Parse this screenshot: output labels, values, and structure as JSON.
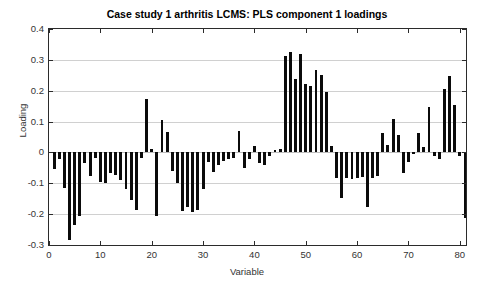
{
  "chart_data": {
    "type": "bar",
    "title": "Case study 1 arthritis LCMS: PLS component 1 loadings",
    "xlabel": "Variable",
    "ylabel": "Loading",
    "xlim": [
      0,
      81.2
    ],
    "ylim": [
      -0.3,
      0.4
    ],
    "grid": true,
    "legend": null,
    "xticks": [
      0,
      10,
      20,
      30,
      40,
      50,
      60,
      70,
      80
    ],
    "yticks": [
      -0.3,
      -0.2,
      -0.1,
      0,
      0.1,
      0.2,
      0.3,
      0.4
    ],
    "ytick_labels": [
      "-0.3",
      "-0.2",
      "-0.1",
      "0",
      "0.1",
      "0.2",
      "0.3",
      "0.4"
    ],
    "xtick_labels": [
      "0",
      "10",
      "20",
      "30",
      "40",
      "50",
      "60",
      "70",
      "80"
    ],
    "bar_color": "#0b0b0b",
    "categories": [
      1,
      2,
      3,
      4,
      5,
      6,
      7,
      8,
      9,
      10,
      11,
      12,
      13,
      14,
      15,
      16,
      17,
      18,
      19,
      20,
      21,
      22,
      23,
      24,
      25,
      26,
      27,
      28,
      29,
      30,
      31,
      32,
      33,
      34,
      35,
      36,
      37,
      38,
      39,
      40,
      41,
      42,
      43,
      44,
      45,
      46,
      47,
      48,
      49,
      50,
      51,
      52,
      53,
      54,
      55,
      56,
      57,
      58,
      59,
      60,
      61,
      62,
      63,
      64,
      65,
      66,
      67,
      68,
      69,
      70,
      71,
      72,
      73,
      74,
      75,
      76,
      77,
      78,
      79,
      80,
      81
    ],
    "values": [
      -0.055,
      -0.022,
      -0.115,
      -0.285,
      -0.235,
      -0.205,
      -0.035,
      -0.075,
      -0.018,
      -0.095,
      -0.1,
      -0.068,
      -0.072,
      -0.09,
      -0.12,
      -0.155,
      -0.185,
      -0.018,
      0.173,
      0.01,
      -0.205,
      0.105,
      0.065,
      -0.06,
      -0.098,
      -0.19,
      -0.178,
      -0.192,
      -0.185,
      -0.12,
      -0.03,
      -0.062,
      -0.04,
      -0.028,
      -0.022,
      -0.018,
      0.068,
      -0.05,
      -0.022,
      0.02,
      -0.035,
      -0.042,
      -0.012,
      0.008,
      0.012,
      0.312,
      0.325,
      0.238,
      0.318,
      0.222,
      0.215,
      0.268,
      0.252,
      0.195,
      0.022,
      -0.082,
      -0.148,
      -0.082,
      -0.085,
      -0.082,
      -0.08,
      -0.178,
      -0.082,
      -0.078,
      0.062,
      0.025,
      0.108,
      0.055,
      -0.068,
      -0.03,
      -0.005,
      0.062,
      0.018,
      0.148,
      -0.01,
      -0.02,
      0.205,
      0.248,
      0.155,
      -0.012,
      -0.212
    ]
  }
}
